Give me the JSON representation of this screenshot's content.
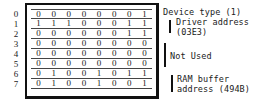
{
  "table": {
    "row_numbers": [
      "0",
      "1",
      "2",
      "3",
      "4",
      "5",
      "6",
      "7"
    ],
    "rows": [
      [
        "0",
        "0",
        "0",
        "0",
        "0",
        "0",
        "0",
        "1"
      ],
      [
        "1",
        "1",
        "1",
        "0",
        "0",
        "0",
        "1",
        "1"
      ],
      [
        "0",
        "0",
        "0",
        "0",
        "0",
        "0",
        "1",
        "1"
      ],
      [
        "0",
        "0",
        "0",
        "0",
        "0",
        "0",
        "0",
        "0"
      ],
      [
        "0",
        "0",
        "0",
        "0",
        "0",
        "0",
        "0",
        "0"
      ],
      [
        "0",
        "0",
        "0",
        "0",
        "0",
        "0",
        "0",
        "0"
      ],
      [
        "0",
        "1",
        "0",
        "0",
        "1",
        "0",
        "1",
        "1"
      ],
      [
        "0",
        "1",
        "0",
        "0",
        "1",
        "0",
        "0",
        "1"
      ]
    ]
  },
  "annotations": {
    "device_type": "Device type (1)",
    "driver_address_line1": "Driver address",
    "driver_address_line2": "(03E3)",
    "not_used": "Not Used",
    "ram_buffer_line1": "RAM buffer",
    "ram_buffer_line2": "address (494B)"
  }
}
